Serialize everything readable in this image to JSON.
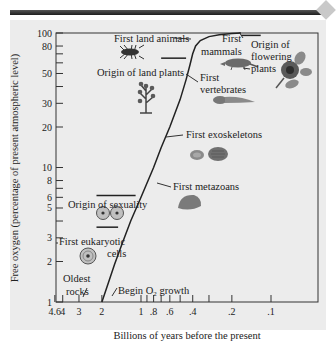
{
  "chart_data": {
    "type": "line",
    "title": "",
    "xlabel": "Billions of years before the present",
    "ylabel": "Free oxygen (percentage of present atmospheric level)",
    "xscale": "log",
    "yscale": "log",
    "x_reversed": true,
    "xlim": [
      4.6,
      0.065
    ],
    "ylim": [
      1,
      100
    ],
    "grid": false,
    "x_ticks": [
      {
        "value": 4.6,
        "label": "4.6"
      },
      {
        "value": 4,
        "label": "4"
      },
      {
        "value": 3,
        "label": "3"
      },
      {
        "value": 2,
        "label": "2"
      },
      {
        "value": 1,
        "label": "1"
      },
      {
        "value": 0.9,
        "label": ""
      },
      {
        "value": 0.8,
        "label": ".8"
      },
      {
        "value": 0.7,
        "label": ""
      },
      {
        "value": 0.6,
        "label": ".6"
      },
      {
        "value": 0.5,
        "label": ""
      },
      {
        "value": 0.4,
        "label": ".4"
      },
      {
        "value": 0.3,
        "label": ""
      },
      {
        "value": 0.2,
        "label": ".2"
      },
      {
        "value": 0.1,
        "label": ".1"
      }
    ],
    "y_ticks": [
      {
        "value": 100,
        "label": "100"
      },
      {
        "value": 80,
        "label": "80"
      },
      {
        "value": 70,
        "label": ""
      },
      {
        "value": 60,
        "label": ""
      },
      {
        "value": 50,
        "label": "50"
      },
      {
        "value": 40,
        "label": ""
      },
      {
        "value": 30,
        "label": "30"
      },
      {
        "value": 20,
        "label": "20"
      },
      {
        "value": 10,
        "label": "10"
      },
      {
        "value": 8,
        "label": "8"
      },
      {
        "value": 7,
        "label": ""
      },
      {
        "value": 6,
        "label": "6"
      },
      {
        "value": 5,
        "label": "5"
      },
      {
        "value": 4,
        "label": ""
      },
      {
        "value": 3,
        "label": "3"
      },
      {
        "value": 2,
        "label": "2"
      },
      {
        "value": 1,
        "label": "1"
      }
    ],
    "series": [
      {
        "name": "Free oxygen",
        "x": [
          2.0,
          1.8,
          1.6,
          1.4,
          1.2,
          1.0,
          0.8,
          0.7,
          0.6,
          0.5,
          0.45,
          0.42,
          0.4,
          0.38,
          0.35,
          0.3,
          0.25,
          0.2,
          0.17
        ],
        "y": [
          1.0,
          1.35,
          1.9,
          2.7,
          4.0,
          6.0,
          10.0,
          14.0,
          20.0,
          32.0,
          45.0,
          58.0,
          70.0,
          80.0,
          88.0,
          94.0,
          97.0,
          99.0,
          100.0
        ]
      }
    ],
    "annotations": [
      {
        "text": "Oldest",
        "x": 3.4,
        "y": 1.6
      },
      {
        "text": "rocks",
        "x": 3.4,
        "y": 1.25
      },
      {
        "text": "Begin O2 growth",
        "x": 1.25,
        "y": 1.15
      },
      {
        "text": "First eukaryotic",
        "x": 3.5,
        "y": 3.0
      },
      {
        "text": "cells",
        "x": 2.2,
        "y": 2.4
      },
      {
        "text": "Origin of sexuality",
        "x": 2.7,
        "y": 5.8
      },
      {
        "text": "First metazoans",
        "x": 0.55,
        "y": 7.3
      },
      {
        "text": "First exoskeletons",
        "x": 0.35,
        "y": 17.0
      },
      {
        "text": "Origin of land plants",
        "x": 0.9,
        "y": 55.0
      },
      {
        "text": "First vertebrates",
        "x": 0.4,
        "y": 48.0
      },
      {
        "text": "First land animals",
        "x": 0.8,
        "y": 88.0
      },
      {
        "text": "First mammals",
        "x": 0.28,
        "y": 88.0
      },
      {
        "text": "Origin of flowering plants",
        "x": 0.13,
        "y": 80.0
      }
    ],
    "range_bars": [
      {
        "label": "Origin of land plants",
        "x_from": 0.7,
        "x_to": 0.45,
        "y": 65
      },
      {
        "label": "Origin of sexuality (upper)",
        "x_from": 2.2,
        "x_to": 1.1,
        "y": 6.2
      },
      {
        "label": "Origin of sexuality (lower)",
        "x_from": 2.2,
        "x_to": 1.5,
        "y": 3.6
      },
      {
        "label": "Origin of flowering plants",
        "x_from": 0.17,
        "x_to": 0.12,
        "y": 96
      }
    ],
    "y_label_lines": [
      "Free oxygen (percentage of present atmospheric level)"
    ]
  }
}
